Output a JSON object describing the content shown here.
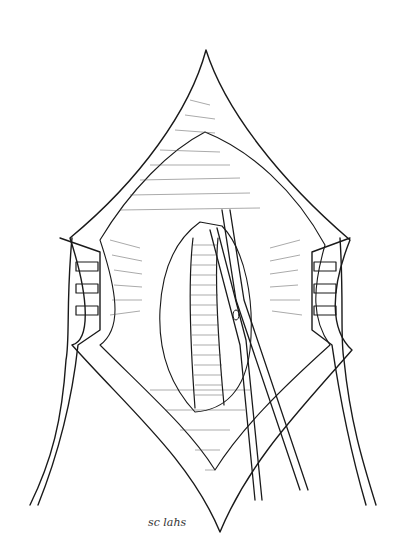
{
  "illustration": {
    "subject": "surgical-incision-with-retractors-and-forceps",
    "style": "black-and-white pen-and-ink line drawing",
    "elements": [
      "diamond-shaped incision wound",
      "left rake retractor (3 prongs)",
      "right rake retractor (3 prongs)",
      "exposed tubular vessel with ribbed texture",
      "surgical forceps / clamp"
    ],
    "signature_text": "sc lahs",
    "colors": {
      "ink": "#1a1a1a",
      "background": "#ffffff",
      "shading": "#555555"
    }
  }
}
